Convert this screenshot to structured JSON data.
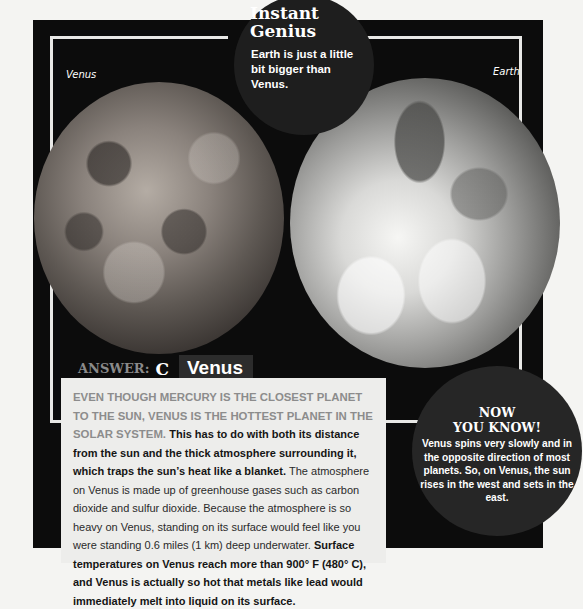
{
  "instant_genius": {
    "title_line1": "Instant",
    "title_line2": "Genius",
    "body": "Earth is just a little bit bigger than Venus."
  },
  "images": {
    "left_label": "Venus",
    "right_label": "Earth"
  },
  "answer": {
    "prefix": "ANSWER:",
    "letter": "C",
    "word": "Venus"
  },
  "article": {
    "lead": "Even though Mercury is the closest planet to the sun, Venus is the hottest planet in the solar system.",
    "bold1": "This has to do with both its distance from the sun and the thick atmosphere surrounding it, which traps the sun’s heat like a blanket.",
    "normal": "The atmosphere on Venus is made up of greenhouse gases such as carbon dioxide and sulfur dioxide. Because the atmosphere is so heavy on Venus, standing on its surface would feel like you were standing 0.6 miles (1 km) deep underwater.",
    "bold2": "Surface temperatures on Venus reach more than 900° F (480° C), and Venus is actually so hot that metals like lead would immediately melt into liquid on its surface."
  },
  "now_you_know": {
    "title_line1": "NOW",
    "title_line2": "YOU KNOW!",
    "body": "Venus spins very slowly and in the opposite direction of most planets. So, on Venus, the sun rises in the west and sets in the east."
  },
  "colors": {
    "panel": "#0c0c0c",
    "frame": "#e8e8e6",
    "text_box": "#ededeb",
    "lead_gray": "#8c8c8c"
  }
}
